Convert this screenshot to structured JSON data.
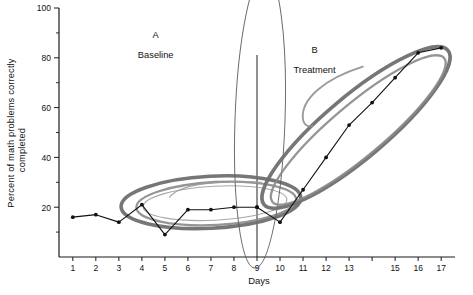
{
  "chart_data": {
    "type": "line",
    "title": "",
    "xlabel": "Days",
    "ylabel": "Percent of math problems correctly completed",
    "xlim": [
      0.4,
      17.6
    ],
    "ylim": [
      0,
      100
    ],
    "grid": false,
    "legend_position": "none",
    "y_ticks": [
      20,
      40,
      60,
      80,
      100
    ],
    "y_tick_labels": [
      "20",
      "40",
      "60",
      "80",
      "100"
    ],
    "y_minor_ticks": [
      10,
      30,
      50,
      70,
      90
    ],
    "x_ticks": [
      1,
      2,
      3,
      4,
      5,
      6,
      7,
      8,
      9,
      10,
      11,
      12,
      13,
      14,
      15,
      16,
      17
    ],
    "x_tick_labels": [
      "1",
      "2",
      "3",
      "4",
      "5",
      "6",
      "7",
      "8",
      "9",
      "10",
      "11",
      "12",
      "13",
      "15",
      "16",
      "17"
    ],
    "series": [
      {
        "name": "A Baseline",
        "x": [
          1,
          2,
          3,
          4,
          5,
          6,
          7,
          8,
          9
        ],
        "values": [
          16,
          17,
          14,
          21,
          9,
          19,
          19,
          20,
          20
        ]
      },
      {
        "name": "B Treatment",
        "x": [
          9,
          10,
          11,
          12,
          13,
          14,
          15,
          16,
          17
        ],
        "values": [
          20,
          14,
          27,
          40,
          53,
          62,
          72,
          82,
          84
        ]
      }
    ],
    "annotations": [
      {
        "name": "phase-a-label",
        "text": "A",
        "x": 4.6,
        "y": 88
      },
      {
        "name": "phase-a-sublabel",
        "text": "Baseline",
        "x": 4.6,
        "y": 80
      },
      {
        "name": "phase-b-label",
        "text": "B",
        "x": 11.5,
        "y": 82
      },
      {
        "name": "phase-b-sublabel",
        "text": "Treatment",
        "x": 11.5,
        "y": 74
      },
      {
        "name": "phase-change-line",
        "text": "",
        "x": 9,
        "y": 0
      }
    ],
    "highlight_shapes": [
      {
        "name": "baseline-cluster-ellipse",
        "shape": "ellipse",
        "center_x": 7.0,
        "center_y": 22,
        "color": "#6f6f6f"
      },
      {
        "name": "baseline-cluster-ellipse-inner",
        "shape": "ellipse",
        "center_x": 7.0,
        "center_y": 22,
        "color": "#9a9a9a"
      },
      {
        "name": "phase-change-ellipse",
        "shape": "ellipse",
        "center_x": 9.0,
        "center_y": 55,
        "color": "#5c5c5c"
      },
      {
        "name": "treatment-trend-ellipse",
        "shape": "ellipse",
        "center_x": 13.3,
        "center_y": 52,
        "color": "#7a7a7a"
      },
      {
        "name": "treatment-pointer-hook",
        "shape": "arc",
        "center_x": 11.6,
        "center_y": 66,
        "color": "#8f8f8f"
      }
    ],
    "colors": {
      "data_line": "#111111",
      "axis": "#1a1a1a",
      "annotation_dark": "#6f6f6f",
      "annotation_light": "#9a9a9a"
    }
  }
}
